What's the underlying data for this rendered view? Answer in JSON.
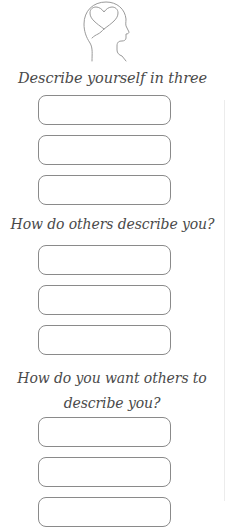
{
  "worksheet": {
    "icon": "head-with-heart-icon",
    "colors": {
      "text": "#4a4a4a",
      "box_border": "#8a8a8a",
      "icon_stroke": "#9a9a9a",
      "background": "#ffffff"
    },
    "sections": [
      {
        "prompt": "Describe yourself in three words.",
        "answers": [
          "",
          "",
          ""
        ]
      },
      {
        "prompt": "How do others describe you?",
        "answers": [
          "",
          "",
          ""
        ]
      },
      {
        "prompt": "How do you want others to describe you?",
        "answers": [
          "",
          "",
          ""
        ]
      }
    ]
  }
}
